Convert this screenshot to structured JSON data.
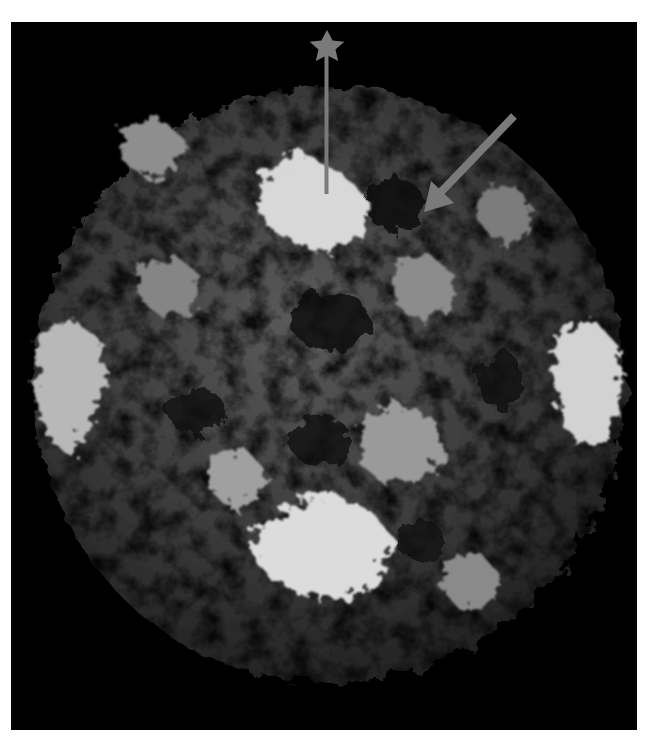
{
  "figure": {
    "background_color": "#000000",
    "frame_color": "#ffffff",
    "annotations": [
      {
        "type": "star-marker",
        "color": "#7a7a7a",
        "label": "star"
      },
      {
        "type": "arrow",
        "color": "#7a7a7a",
        "label": "arrow"
      }
    ]
  }
}
